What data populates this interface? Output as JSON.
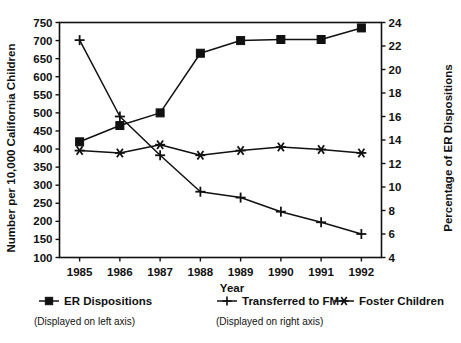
{
  "chart_data": {
    "type": "line",
    "title": "",
    "xlabel": "Year",
    "ylabel": "Number per 10,000 California Children",
    "y2label": "Percentage of ER Dispositions",
    "categories": [
      "1985",
      "1986",
      "1987",
      "1988",
      "1989",
      "1990",
      "1991",
      "1992"
    ],
    "x": [
      1985,
      1986,
      1987,
      1988,
      1989,
      1990,
      1991,
      1992
    ],
    "ylim": [
      100,
      750
    ],
    "y2lim": [
      4,
      24
    ],
    "yticks": [
      100,
      150,
      200,
      250,
      300,
      350,
      400,
      450,
      500,
      550,
      600,
      650,
      700,
      750
    ],
    "y2ticks": [
      4,
      6,
      8,
      10,
      12,
      14,
      16,
      18,
      20,
      22,
      24
    ],
    "grid": false,
    "legend_position": "bottom",
    "series": [
      {
        "name": "ER Dispositions",
        "axis": "left",
        "marker": "square",
        "note": "(Displayed on left axis)",
        "values": [
          420,
          465,
          500,
          665,
          700,
          703,
          703,
          735
        ]
      },
      {
        "name": "Transferred to FM",
        "axis": "right",
        "marker": "plus",
        "note": "(Displayed on right axis)",
        "values": [
          22.5,
          16.0,
          12.7,
          9.6,
          9.1,
          7.9,
          7.0,
          6.0
        ]
      },
      {
        "name": "Foster Children",
        "axis": "right",
        "marker": "asterisk",
        "note": "(Displayed on right axis)",
        "values": [
          13.1,
          12.9,
          13.6,
          12.7,
          13.1,
          13.4,
          13.2,
          12.9
        ]
      }
    ]
  },
  "axes": {
    "left_title": "Number per 10,000 California Children",
    "right_title": "Percentage of ER Dispositions",
    "x_title": "Year"
  },
  "legend": {
    "items": [
      {
        "label": "ER Dispositions",
        "marker": "square-marker-icon"
      },
      {
        "label": "Transferred to FM",
        "marker": "plus-marker-icon"
      },
      {
        "label": "Foster Children",
        "marker": "asterisk-marker-icon"
      }
    ],
    "note_left": "(Displayed on left axis)",
    "note_right": "(Displayed on right axis)"
  },
  "colors": {
    "ink": "#111111",
    "background": "#ffffff"
  }
}
